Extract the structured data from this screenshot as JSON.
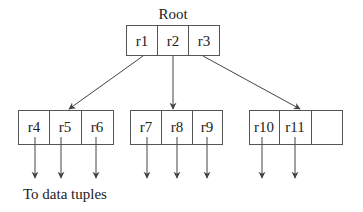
{
  "diagram": {
    "title": "Root",
    "root_node": {
      "entries": [
        "r1",
        "r2",
        "r3"
      ]
    },
    "leaf_nodes": [
      {
        "entries": [
          "r4",
          "r5",
          "r6"
        ]
      },
      {
        "entries": [
          "r7",
          "r8",
          "r9"
        ]
      },
      {
        "entries": [
          "r10",
          "r11",
          ""
        ]
      }
    ],
    "caption": "To data tuples"
  }
}
